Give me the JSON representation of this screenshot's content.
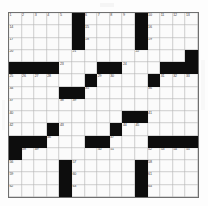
{
  "puzzle": {
    "title": "Crossword Grid",
    "size_label": "15x15",
    "rows": 15,
    "cols": 15,
    "block_color": "#0d0d0d",
    "cell_color": "#fbfbfb",
    "grid_line_color": "#9a9a9a",
    "number_color": "#3a3a3a",
    "layout": [
      [
        "1",
        "2",
        "3",
        "4",
        "5",
        "#",
        "6",
        "7",
        "8",
        "9",
        "#",
        "10",
        "11",
        "12",
        "13"
      ],
      [
        "14",
        "",
        "",
        "",
        "",
        "#",
        "15",
        "",
        "",
        "",
        "#",
        "16",
        "",
        "",
        ""
      ],
      [
        "17",
        "",
        "",
        "",
        "",
        "#",
        "18",
        "",
        "",
        "",
        "#",
        "19",
        "",
        "",
        ""
      ],
      [
        "20",
        "",
        "",
        "",
        "",
        "21",
        "",
        "",
        "",
        "",
        "22",
        "",
        "",
        "",
        "#"
      ],
      [
        "#",
        "#",
        "#",
        "#",
        "23",
        "",
        "",
        "#",
        "#",
        "24",
        "",
        "",
        "#",
        "#",
        "#"
      ],
      [
        "25",
        "26",
        "27",
        "28",
        "",
        "",
        "#",
        "29",
        "30",
        "",
        "",
        "#",
        "31",
        "32",
        "33"
      ],
      [
        "34",
        "",
        "",
        "",
        "#",
        "#",
        "35",
        "",
        "",
        "",
        "",
        "36",
        "",
        "",
        ""
      ],
      [
        "37",
        "",
        "",
        "",
        "38",
        "39",
        "",
        "",
        "",
        "",
        "",
        "",
        "",
        "",
        ""
      ],
      [
        "40",
        "",
        "",
        "",
        "",
        "",
        "",
        "",
        "",
        "#",
        "#",
        "41",
        "",
        "",
        ""
      ],
      [
        "42",
        "",
        "",
        "#",
        "43",
        "",
        "",
        "",
        "#",
        "44",
        "45",
        "",
        "",
        "",
        ""
      ],
      [
        "#",
        "#",
        "#",
        "46",
        "",
        "",
        "#",
        "#",
        "47",
        "",
        "",
        "#",
        "#",
        "#",
        "#"
      ],
      [
        "#",
        "48",
        "49",
        "",
        "",
        "",
        "",
        "50",
        "51",
        "",
        "",
        "52",
        "53",
        "54",
        "55"
      ],
      [
        "56",
        "",
        "",
        "",
        "#",
        "57",
        "",
        "",
        "",
        "",
        "#",
        "58",
        "",
        "",
        ""
      ],
      [
        "59",
        "",
        "",
        "",
        "#",
        "60",
        "",
        "",
        "",
        "",
        "#",
        "61",
        "",
        "",
        ""
      ],
      [
        "62",
        "",
        "",
        "",
        "#",
        "63",
        "",
        "",
        "",
        "",
        "#",
        "64",
        "",
        "",
        ""
      ]
    ]
  }
}
